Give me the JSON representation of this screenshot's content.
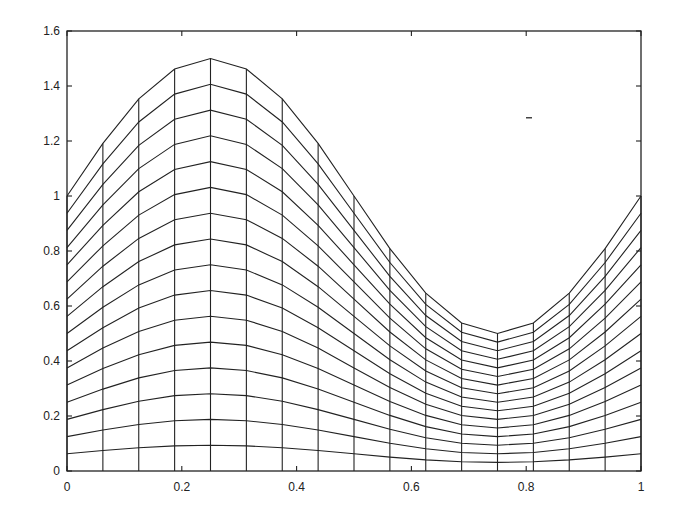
{
  "chart_data": {
    "type": "line",
    "title": "",
    "xlabel": "",
    "ylabel": "",
    "xlim": [
      0,
      1
    ],
    "ylim": [
      0,
      1.6
    ],
    "grid": false,
    "legend": null,
    "x_ticks": [
      0,
      0.2,
      0.4,
      0.6,
      0.8,
      1
    ],
    "x_tick_labels": [
      "0",
      "0.2",
      "0.4",
      "0.6",
      "0.8",
      "1"
    ],
    "y_ticks": [
      0,
      0.2,
      0.4,
      0.6,
      0.8,
      1,
      1.2,
      1.4,
      1.6
    ],
    "y_tick_labels": [
      "0",
      "0.2",
      "0.4",
      "0.6",
      "0.8",
      "1",
      "1.2",
      "1.4",
      "1.6"
    ],
    "mesh": {
      "n_layers": 16,
      "x_nodes": [
        0,
        0.0625,
        0.125,
        0.1875,
        0.25,
        0.3125,
        0.375,
        0.4375,
        0.5,
        0.5625,
        0.625,
        0.6875,
        0.75,
        0.8125,
        0.875,
        0.9375,
        1
      ],
      "top_surface": [
        1.0,
        1.1913,
        1.3536,
        1.4619,
        1.5,
        1.4619,
        1.3536,
        1.1913,
        1.0,
        0.8087,
        0.6464,
        0.5381,
        0.5,
        0.5381,
        0.6464,
        0.8087,
        1.0
      ]
    },
    "series": [
      {
        "name": "top boundary h(x)",
        "x": [
          0,
          0.0625,
          0.125,
          0.1875,
          0.25,
          0.3125,
          0.375,
          0.4375,
          0.5,
          0.5625,
          0.625,
          0.6875,
          0.75,
          0.8125,
          0.875,
          0.9375,
          1
        ],
        "values": [
          1.0,
          1.1913,
          1.3536,
          1.4619,
          1.5,
          1.4619,
          1.3536,
          1.1913,
          1.0,
          0.8087,
          0.6464,
          0.5381,
          0.5,
          0.5381,
          0.6464,
          0.8087,
          1.0
        ]
      }
    ]
  },
  "layout": {
    "plot_left": 67,
    "plot_right": 641,
    "plot_top": 31,
    "plot_bottom": 471,
    "line_color": "#222222",
    "background": "#ffffff"
  }
}
